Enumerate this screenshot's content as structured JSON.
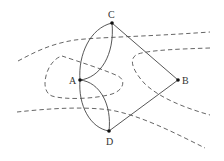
{
  "diagram": {
    "type": "graph",
    "nodes": [
      {
        "id": "A",
        "label": "A",
        "x": 80,
        "y": 80,
        "label_x": 69,
        "label_y": 84
      },
      {
        "id": "B",
        "label": "B",
        "x": 178,
        "y": 80,
        "label_x": 182,
        "label_y": 84
      },
      {
        "id": "C",
        "label": "C",
        "x": 112,
        "y": 23,
        "label_x": 108,
        "label_y": 18
      },
      {
        "id": "D",
        "label": "D",
        "x": 109,
        "y": 131,
        "label_x": 106,
        "label_y": 145
      }
    ],
    "edges": [
      {
        "from": "A",
        "to": "C",
        "kind": "outer-arc"
      },
      {
        "from": "A",
        "to": "C",
        "kind": "inner-arc"
      },
      {
        "from": "A",
        "to": "D",
        "kind": "outer-arc"
      },
      {
        "from": "A",
        "to": "D",
        "kind": "inner-arc"
      },
      {
        "from": "A",
        "to": "B",
        "kind": "none"
      },
      {
        "from": "C",
        "to": "B",
        "kind": "line"
      },
      {
        "from": "D",
        "to": "B",
        "kind": "line"
      }
    ],
    "river_banks": [
      "top-bank",
      "upper-right-bank",
      "lower-bank",
      "island-loop"
    ],
    "colors": {
      "edge": "#444444",
      "dash": "#555555",
      "node": "#111111",
      "label": "#333333"
    }
  }
}
